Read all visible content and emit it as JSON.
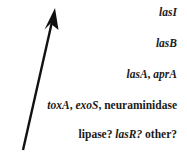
{
  "figure": {
    "background_color": "#ffffff",
    "ink_color": "#1a1a1a",
    "arrow": {
      "name": "upward-diagonal-arrow",
      "direction": "up-right",
      "tail": {
        "x": 23,
        "y": 150
      },
      "tip": {
        "x": 55,
        "y": 9
      },
      "color": "#111111"
    },
    "lines": [
      {
        "id": "line-1",
        "segments": [
          {
            "text": "lasI",
            "style": "italic"
          }
        ]
      },
      {
        "id": "line-2",
        "segments": [
          {
            "text": "lasB",
            "style": "italic"
          }
        ]
      },
      {
        "id": "line-3",
        "segments": [
          {
            "text": "lasA",
            "style": "italic"
          },
          {
            "text": ", ",
            "style": "normal"
          },
          {
            "text": "aprA",
            "style": "italic"
          }
        ]
      },
      {
        "id": "line-4",
        "segments": [
          {
            "text": "toxA",
            "style": "italic"
          },
          {
            "text": ", ",
            "style": "normal"
          },
          {
            "text": "exoS",
            "style": "italic"
          },
          {
            "text": ", ",
            "style": "normal"
          },
          {
            "text": "neuraminidase",
            "style": "normal"
          }
        ]
      },
      {
        "id": "line-5",
        "segments": [
          {
            "text": "lipase?",
            "style": "normal"
          },
          {
            "text": " ",
            "style": "normal"
          },
          {
            "text": "lasR?",
            "style": "italic"
          },
          {
            "text": " ",
            "style": "normal"
          },
          {
            "text": "other?",
            "style": "normal"
          }
        ]
      }
    ]
  }
}
